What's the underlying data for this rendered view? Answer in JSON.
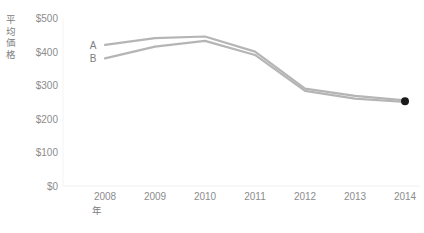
{
  "chart_data": {
    "type": "line",
    "title": "",
    "xlabel": "年",
    "ylabel": "平均価格",
    "x": [
      2008,
      2009,
      2010,
      2011,
      2012,
      2013,
      2014
    ],
    "categories": [
      "2008",
      "2009",
      "2010",
      "2011",
      "2012",
      "2013",
      "2014"
    ],
    "series": [
      {
        "name": "A",
        "values": [
          420,
          440,
          445,
          400,
          290,
          268,
          255
        ],
        "color": "#b5b5b5"
      },
      {
        "name": "B",
        "values": [
          380,
          415,
          432,
          390,
          283,
          260,
          250
        ],
        "color": "#b5b5b5"
      }
    ],
    "ylim": [
      0,
      500
    ],
    "yticks": [
      0,
      100,
      200,
      300,
      400,
      500
    ],
    "ytick_labels": [
      "$0",
      "$100",
      "$200",
      "$300",
      "$400",
      "$500"
    ],
    "grid": false,
    "legend": "inline-series-labels",
    "marker": {
      "at_x": 2014,
      "shape": "circle",
      "color": "#1a1a1a",
      "radius": 4
    }
  },
  "axes": {
    "y_title": "平均価格",
    "x_title": "年",
    "y_tick_labels": [
      "$500",
      "$400",
      "$300",
      "$200",
      "$100",
      "$0"
    ],
    "x_tick_labels": [
      "2008",
      "2009",
      "2010",
      "2011",
      "2012",
      "2013",
      "2014"
    ]
  },
  "series_labels": {
    "a": "A",
    "b": "B"
  },
  "colors": {
    "line": "#b5b5b5",
    "marker": "#1a1a1a",
    "axis": "#efefef",
    "text": "#8c8c8c"
  }
}
